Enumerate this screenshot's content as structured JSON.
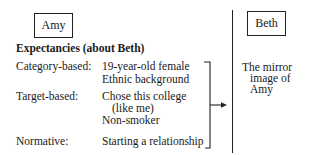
{
  "left": {
    "person_box": "Amy",
    "heading": "Expectancies (about Beth)",
    "rows": [
      {
        "label": "Category-based:",
        "values": [
          "19-year-old female",
          "Ethnic background"
        ]
      },
      {
        "label": "Target-based:",
        "values": [
          "Chose this college",
          "(like me)",
          "Non-smoker"
        ]
      },
      {
        "label": "Normative:",
        "values": [
          "Starting a relationship"
        ]
      }
    ]
  },
  "right": {
    "person_box": "Beth",
    "description": [
      "The mirror",
      "image of",
      "Amy"
    ]
  },
  "connector": {
    "type": "bracket-arrow",
    "direction": "right"
  }
}
